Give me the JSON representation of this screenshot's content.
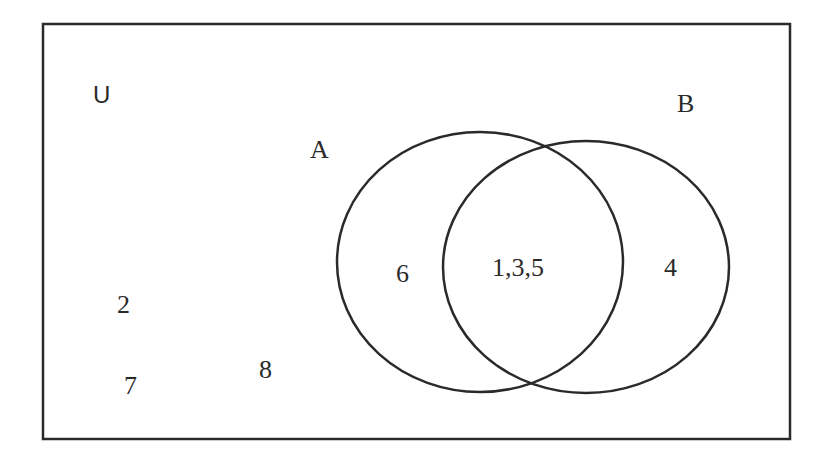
{
  "diagram": {
    "type": "venn",
    "universe_label": "U",
    "sets": [
      {
        "name": "A",
        "label": "A"
      },
      {
        "name": "B",
        "label": "B"
      }
    ],
    "regions": {
      "a_only": "6",
      "a_and_b": "1,3,5",
      "b_only": "4",
      "outside": [
        "2",
        "7",
        "8"
      ]
    },
    "line_color": "#2a2a2a"
  }
}
